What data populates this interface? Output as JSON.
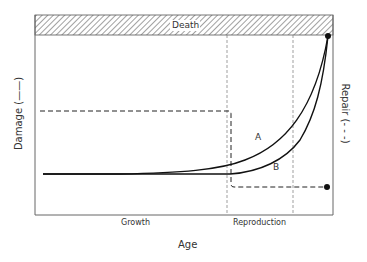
{
  "diagram": {
    "band_label": "Death",
    "x_axis_label": "Age",
    "left_axis_label": "Damage (——)",
    "right_axis_label": "Repair (- - -)",
    "phase_labels": [
      "Growth",
      "Reproduction"
    ],
    "curve_labels": [
      "A",
      "B"
    ],
    "colors": {
      "line": "#1a1a1a",
      "frame": "#555555",
      "background": "#ffffff"
    }
  }
}
